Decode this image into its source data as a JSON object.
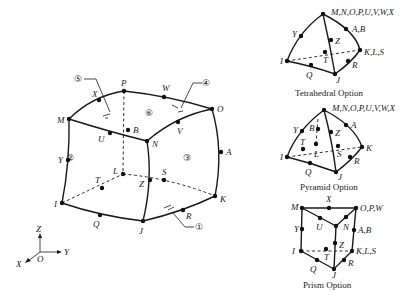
{
  "main_figure": {
    "nodes": {
      "M": "M",
      "N": "N",
      "O": "O",
      "P": "P",
      "I": "I",
      "J": "J",
      "K": "K",
      "L": "L",
      "Q": "Q",
      "R": "R",
      "S": "S",
      "T": "T",
      "U": "U",
      "V": "V",
      "W": "W",
      "X": "X",
      "Y": "Y",
      "Z": "Z",
      "A": "A",
      "B": "B"
    },
    "faces": {
      "f1": "①",
      "f2": "②",
      "f3": "③",
      "f4": "④",
      "f5": "⑤",
      "f6": "⑥"
    },
    "axes": {
      "x": "X",
      "y": "Y",
      "z": "Z",
      "origin": "O"
    }
  },
  "tetrahedral": {
    "caption": "Tetrahedral Option",
    "top": "M,N,O,P,U,V,W,X",
    "ab": "A,B",
    "kls": "K,L,S",
    "y": "Y",
    "z": "Z",
    "t": "T",
    "i": "I",
    "q": "Q",
    "j": "J",
    "r": "R"
  },
  "pyramid": {
    "caption": "Pyramid Option",
    "top": "M,N,O,P,U,V,W,X",
    "a": "A",
    "k": "K",
    "b": "B",
    "y": "Y",
    "z": "Z",
    "t": "T",
    "l": "L",
    "s": "S",
    "i": "I",
    "q": "Q",
    "j": "J",
    "r": "R"
  },
  "prism": {
    "caption": "Prism Option",
    "m": "M",
    "x": "X",
    "opw": "O,P,W",
    "y": "Y",
    "u": "U",
    "n": "N",
    "ab": "A,B",
    "z": "Z",
    "t": "T",
    "i": "I",
    "kls": "K,L,S",
    "q": "Q",
    "r": "R",
    "j": "J"
  }
}
